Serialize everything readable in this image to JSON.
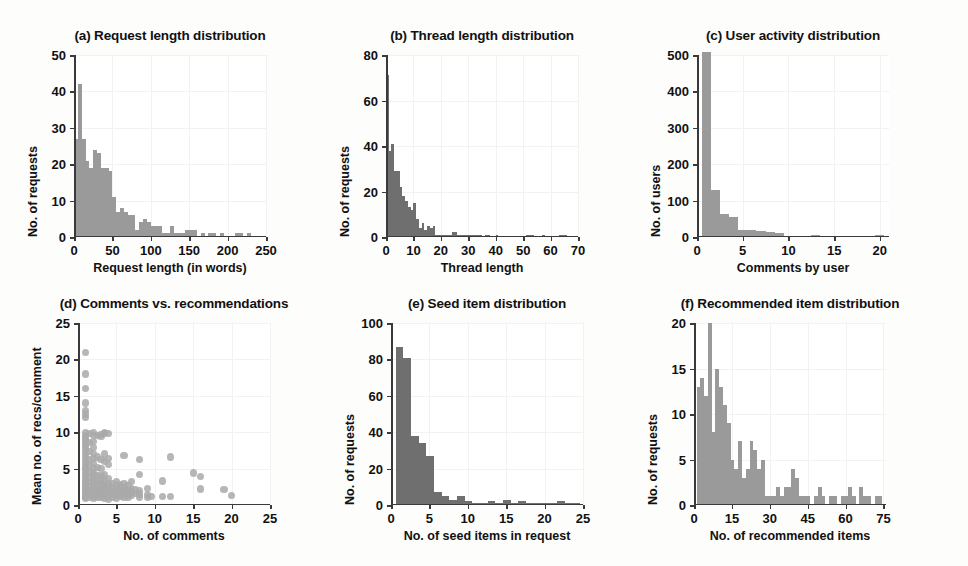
{
  "figure": {
    "background_color": "#ffffff",
    "bar_color": "#9a9a9a",
    "bar_color_dark": "#6f6f6f",
    "dot_color": "#a9a9a9",
    "axis_color": "#3a3a3a",
    "text_color": "#111111"
  },
  "chart_data": [
    {
      "id": "a",
      "type": "bar",
      "title": "(a) Request length distribution",
      "xlabel": "Request length (in words)",
      "ylabel": "No. of requests",
      "xlim": [
        0,
        250
      ],
      "ylim": [
        0,
        50
      ],
      "xticks": [
        0,
        50,
        100,
        150,
        200,
        250
      ],
      "yticks": [
        0,
        10,
        20,
        30,
        40,
        50
      ],
      "grid": true,
      "bin_width": 5,
      "bin_starts": [
        0,
        5,
        10,
        15,
        20,
        25,
        30,
        35,
        40,
        45,
        50,
        55,
        60,
        65,
        70,
        75,
        80,
        85,
        90,
        95,
        100,
        105,
        110,
        115,
        120,
        125,
        130,
        135,
        140,
        145,
        150,
        155,
        160,
        165,
        170,
        175,
        180,
        185,
        190,
        195,
        200,
        205,
        210,
        215,
        220,
        225,
        230,
        235,
        240,
        245
      ],
      "values": [
        27,
        42,
        27,
        21,
        19,
        24,
        23,
        19,
        19,
        18,
        11,
        7,
        8,
        7,
        6,
        6,
        2,
        4,
        5,
        4,
        3,
        3,
        3,
        1,
        1,
        3,
        1,
        1,
        1,
        2,
        2,
        2,
        0,
        1,
        0,
        1,
        1,
        0,
        1,
        0,
        0,
        0,
        1,
        1,
        0,
        1,
        0,
        0,
        0,
        0
      ]
    },
    {
      "id": "b",
      "type": "bar",
      "title": "(b) Thread length distribution",
      "xlabel": "Thread length",
      "ylabel": "No. of requests",
      "xlim": [
        0,
        70
      ],
      "ylim": [
        0,
        80
      ],
      "xticks": [
        0,
        10,
        20,
        30,
        40,
        50,
        60,
        70
      ],
      "yticks": [
        0,
        20,
        40,
        60,
        80
      ],
      "grid": true,
      "bin_width": 1,
      "bin_starts": [
        0,
        1,
        2,
        3,
        4,
        5,
        6,
        7,
        8,
        9,
        10,
        11,
        12,
        13,
        14,
        15,
        16,
        17,
        18,
        19,
        20,
        21,
        22,
        23,
        24,
        25,
        26,
        27,
        28,
        29,
        30,
        31,
        32,
        33,
        34,
        35,
        36,
        37,
        38,
        39,
        40,
        41,
        42,
        43,
        44,
        45,
        46,
        47,
        48,
        49,
        50,
        51,
        52,
        53,
        54,
        55,
        56,
        57,
        58,
        59,
        60,
        61,
        62,
        63,
        64,
        65,
        66,
        67,
        68,
        69
      ],
      "values": [
        71,
        38,
        41,
        29,
        29,
        22,
        18,
        16,
        13,
        12,
        15,
        8,
        4,
        6,
        3,
        5,
        4,
        5,
        1,
        1,
        1,
        1,
        1,
        1,
        2,
        2,
        1,
        1,
        1,
        1,
        1,
        1,
        1,
        1,
        1,
        0,
        1,
        1,
        0,
        0,
        1,
        0,
        0,
        0,
        0,
        0,
        0,
        0,
        0,
        0,
        0,
        1,
        1,
        1,
        0,
        0,
        0,
        1,
        0,
        0,
        0,
        0,
        0,
        1,
        1,
        1,
        0,
        0,
        0,
        0
      ]
    },
    {
      "id": "c",
      "type": "bar",
      "title": "(c) User activity distribution",
      "xlabel": "Comments by user",
      "ylabel": "No. of users",
      "xlim": [
        0,
        21
      ],
      "ylim": [
        0,
        500
      ],
      "xticks": [
        0,
        5,
        10,
        15,
        20
      ],
      "yticks": [
        0,
        100,
        200,
        300,
        400,
        500
      ],
      "grid": true,
      "bin_width": 1,
      "bin_starts": [
        0.5,
        1.5,
        2.5,
        3.5,
        4.5,
        5.5,
        6.5,
        7.5,
        8.5,
        9.5,
        10.5,
        11.5,
        12.5,
        13.5,
        14.5,
        15.5,
        16.5,
        17.5,
        18.5,
        19.5
      ],
      "values": [
        508,
        128,
        62,
        55,
        18,
        20,
        16,
        15,
        12,
        3,
        3,
        4,
        5,
        3,
        2,
        2,
        2,
        2,
        2,
        5
      ]
    },
    {
      "id": "d",
      "type": "scatter",
      "title": "(d) Comments vs. recommendations",
      "xlabel": "No. of comments",
      "ylabel": "Mean no. of recs/comment",
      "xlim": [
        0,
        25
      ],
      "ylim": [
        0,
        25
      ],
      "xticks": [
        0,
        5,
        10,
        15,
        20,
        25
      ],
      "yticks": [
        0,
        5,
        10,
        15,
        20,
        25
      ],
      "grid": true,
      "points": [
        [
          1,
          21
        ],
        [
          1,
          18
        ],
        [
          1,
          16
        ],
        [
          1,
          14
        ],
        [
          1,
          13
        ],
        [
          1,
          12.5
        ],
        [
          1,
          12
        ],
        [
          1,
          10
        ],
        [
          1,
          9.6
        ],
        [
          1,
          9.2
        ],
        [
          1,
          8.8
        ],
        [
          1,
          8.3
        ],
        [
          1,
          8
        ],
        [
          1,
          7.6
        ],
        [
          1,
          7.2
        ],
        [
          1,
          6.8
        ],
        [
          1,
          6.4
        ],
        [
          1,
          6
        ],
        [
          1,
          5.6
        ],
        [
          1,
          5.2
        ],
        [
          1,
          5
        ],
        [
          1,
          4.6
        ],
        [
          1,
          4.2
        ],
        [
          1,
          3.9
        ],
        [
          1,
          3.5
        ],
        [
          1,
          3.2
        ],
        [
          1,
          3
        ],
        [
          1,
          2.7
        ],
        [
          1,
          2.4
        ],
        [
          1,
          2.1
        ],
        [
          1,
          1.9
        ],
        [
          1,
          1.6
        ],
        [
          1,
          1.3
        ],
        [
          1,
          1.1
        ],
        [
          1,
          0.9
        ],
        [
          1.5,
          9.8
        ],
        [
          1.5,
          8.6
        ],
        [
          1.5,
          7.4
        ],
        [
          1.5,
          6.2
        ],
        [
          1.5,
          5.4
        ],
        [
          1.5,
          4.6
        ],
        [
          1.5,
          3.8
        ],
        [
          1.5,
          3.1
        ],
        [
          1.5,
          2.5
        ],
        [
          1.5,
          2.0
        ],
        [
          1.5,
          1.5
        ],
        [
          1.5,
          1.0
        ],
        [
          2,
          10
        ],
        [
          2,
          9.5
        ],
        [
          2,
          8.7
        ],
        [
          2,
          7.9
        ],
        [
          2,
          7.1
        ],
        [
          2,
          6.4
        ],
        [
          2,
          5.7
        ],
        [
          2,
          5.0
        ],
        [
          2,
          4.5
        ],
        [
          2,
          4.0
        ],
        [
          2,
          3.5
        ],
        [
          2,
          3.1
        ],
        [
          2,
          2.7
        ],
        [
          2,
          2.3
        ],
        [
          2,
          1.9
        ],
        [
          2,
          1.5
        ],
        [
          2,
          1.2
        ],
        [
          2,
          0.9
        ],
        [
          2.5,
          9.5
        ],
        [
          2.5,
          6.6
        ],
        [
          2.5,
          5.2
        ],
        [
          2.5,
          4.0
        ],
        [
          2.5,
          3.2
        ],
        [
          2.5,
          2.6
        ],
        [
          2.5,
          2.0
        ],
        [
          2.5,
          1.5
        ],
        [
          2.5,
          1.1
        ],
        [
          3,
          9.7
        ],
        [
          3,
          9.4
        ],
        [
          3,
          6.2
        ],
        [
          3,
          5.0
        ],
        [
          3,
          4.1
        ],
        [
          3,
          3.4
        ],
        [
          3,
          2.8
        ],
        [
          3,
          2.3
        ],
        [
          3,
          1.8
        ],
        [
          3,
          1.4
        ],
        [
          3,
          1.0
        ],
        [
          3.5,
          10
        ],
        [
          3.5,
          9.8
        ],
        [
          3.5,
          7.0
        ],
        [
          3.5,
          6.0
        ],
        [
          3.5,
          4.2
        ],
        [
          3.5,
          3.3
        ],
        [
          3.5,
          2.7
        ],
        [
          3.5,
          2.2
        ],
        [
          3.5,
          1.7
        ],
        [
          3.5,
          1.3
        ],
        [
          3.5,
          0.9
        ],
        [
          4,
          9.8
        ],
        [
          4,
          6.4
        ],
        [
          4,
          5.6
        ],
        [
          4,
          3.6
        ],
        [
          4,
          3.0
        ],
        [
          4,
          2.5
        ],
        [
          4,
          2.0
        ],
        [
          4,
          1.6
        ],
        [
          4,
          1.2
        ],
        [
          4,
          0.8
        ],
        [
          4.5,
          3.0
        ],
        [
          4.5,
          2.4
        ],
        [
          4.5,
          1.9
        ],
        [
          4.5,
          1.4
        ],
        [
          4.5,
          1.0
        ],
        [
          5,
          3.2
        ],
        [
          5,
          2.6
        ],
        [
          5,
          2.1
        ],
        [
          5,
          1.7
        ],
        [
          5,
          1.3
        ],
        [
          5,
          0.9
        ],
        [
          5.5,
          2.8
        ],
        [
          5.5,
          2.2
        ],
        [
          5.5,
          1.7
        ],
        [
          5.5,
          1.2
        ],
        [
          6,
          6.8
        ],
        [
          6,
          3.0
        ],
        [
          6,
          2.4
        ],
        [
          6,
          1.9
        ],
        [
          6,
          1.4
        ],
        [
          6,
          1.0
        ],
        [
          6.5,
          2.6
        ],
        [
          6.5,
          2.0
        ],
        [
          6.5,
          1.5
        ],
        [
          6.5,
          1.1
        ],
        [
          7,
          3.2
        ],
        [
          7,
          2.3
        ],
        [
          7,
          1.8
        ],
        [
          7,
          1.3
        ],
        [
          7.5,
          2.1
        ],
        [
          7.5,
          1.6
        ],
        [
          8,
          6.3
        ],
        [
          8,
          4.2
        ],
        [
          8,
          2.0
        ],
        [
          8,
          1.5
        ],
        [
          8,
          1.1
        ],
        [
          9,
          2.3
        ],
        [
          9,
          1.4
        ],
        [
          9,
          1.0
        ],
        [
          9.5,
          1.2
        ],
        [
          11,
          3.3
        ],
        [
          11,
          1.2
        ],
        [
          12,
          6.6
        ],
        [
          12,
          1.2
        ],
        [
          15,
          4.4
        ],
        [
          16,
          3.9
        ],
        [
          16,
          2.2
        ],
        [
          19,
          2.1
        ],
        [
          20,
          1.3
        ]
      ]
    },
    {
      "id": "e",
      "type": "bar",
      "title": "(e) Seed item distribution",
      "xlabel": "No. of seed items in request",
      "ylabel": "No. of requests",
      "xlim": [
        0,
        25
      ],
      "ylim": [
        0,
        100
      ],
      "xticks": [
        0,
        5,
        10,
        15,
        20,
        25
      ],
      "yticks": [
        0,
        20,
        40,
        60,
        80,
        100
      ],
      "grid": true,
      "bin_width": 1,
      "bin_starts": [
        0.6,
        1.6,
        2.6,
        3.6,
        4.6,
        5.6,
        6.6,
        7.6,
        8.6,
        9.6,
        10.6,
        11.6,
        12.6,
        13.6,
        14.6,
        15.6,
        16.6,
        17.6,
        18.6,
        19.6,
        20.6,
        21.6,
        22.6,
        23.6
      ],
      "values": [
        87,
        81,
        38,
        34,
        27,
        7,
        5,
        3,
        5,
        2,
        1,
        1,
        2,
        1,
        3,
        1,
        2,
        1,
        1,
        1,
        1,
        2,
        1,
        1
      ]
    },
    {
      "id": "f",
      "type": "bar",
      "title": "(f) Recommended item distribution",
      "xlabel": "No. of recommended items",
      "ylabel": "No. of requests",
      "xlim": [
        0,
        76
      ],
      "ylim": [
        0,
        20
      ],
      "xticks": [
        0,
        15,
        30,
        45,
        60,
        75
      ],
      "yticks": [
        0,
        5,
        10,
        15,
        20
      ],
      "grid": true,
      "bin_width": 1.5,
      "bin_starts": [
        1,
        2.5,
        4,
        5.5,
        7,
        8.5,
        10,
        11.5,
        13,
        14.5,
        16,
        17.5,
        19,
        20.5,
        22,
        23.5,
        25,
        26.5,
        28,
        29.5,
        31,
        32.5,
        34,
        35.5,
        37,
        38.5,
        40,
        41.5,
        43,
        44.5,
        46,
        47.5,
        49,
        50.5,
        52,
        53.5,
        55,
        56.5,
        58,
        59.5,
        61,
        62.5,
        64,
        65.5,
        67,
        68.5,
        70,
        71.5,
        73,
        74.5
      ],
      "values": [
        13,
        14,
        12,
        20,
        8,
        15,
        13,
        11,
        9,
        5,
        4,
        7,
        3,
        4,
        7,
        6,
        4,
        5,
        1,
        1,
        1,
        2,
        1,
        2,
        2,
        4,
        3,
        1,
        1,
        1,
        0,
        1,
        2,
        1,
        0,
        1,
        1,
        0,
        1,
        1,
        2,
        1,
        0,
        2,
        1,
        1,
        0,
        1,
        1,
        0
      ]
    }
  ]
}
